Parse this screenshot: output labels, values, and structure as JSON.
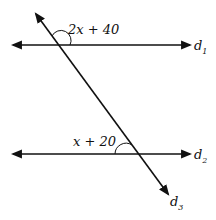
{
  "diagram": {
    "lines": [
      {
        "name": "d1",
        "label": "d",
        "subscript": "1"
      },
      {
        "name": "d2",
        "label": "d",
        "subscript": "2"
      },
      {
        "name": "d3",
        "label": "d",
        "subscript": "3"
      }
    ],
    "angles": [
      {
        "label": "2x + 40",
        "at": "d1 ∩ d3, upper-right"
      },
      {
        "label": "x + 20",
        "at": "d2 ∩ d3, upper-left"
      }
    ],
    "colors": {
      "stroke": "#111111",
      "background": "#ffffff"
    }
  }
}
